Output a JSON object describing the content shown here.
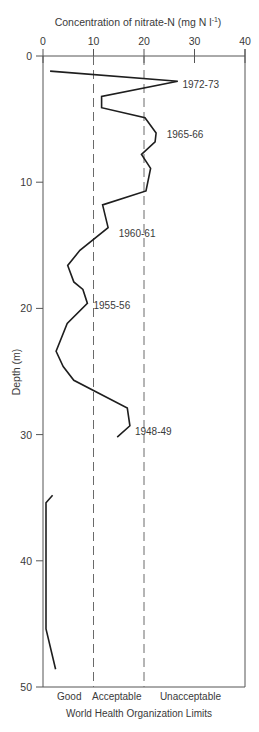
{
  "chart_data": {
    "type": "line",
    "orientation": "depth-profile",
    "title": "",
    "xlabel": "Concentration of nitrate-N (mg N l⁻¹)",
    "xlabel_base": "Concentration of nitrate-N (mg N l",
    "xlabel_sup": "-1",
    "xlabel_close": ")",
    "ylabel": "Depth (m)",
    "xlim": [
      0,
      40
    ],
    "ylim": [
      0,
      50
    ],
    "x_ticks": [
      0,
      10,
      20,
      30,
      40
    ],
    "y_ticks": [
      0,
      10,
      20,
      30,
      40,
      50
    ],
    "x_axis_position": "top",
    "y_inverted": true,
    "grid": false,
    "series": [
      {
        "name": "Nitrate-N profile (upper)",
        "points": [
          {
            "conc": 1.4,
            "depth": 1.2
          },
          {
            "conc": 26.7,
            "depth": 2.0
          },
          {
            "conc": 11.6,
            "depth": 3.2
          },
          {
            "conc": 11.6,
            "depth": 4.1
          },
          {
            "conc": 20.2,
            "depth": 4.9
          },
          {
            "conc": 22.4,
            "depth": 6.1
          },
          {
            "conc": 22.2,
            "depth": 6.8
          },
          {
            "conc": 19.5,
            "depth": 7.8
          },
          {
            "conc": 21.3,
            "depth": 8.9
          },
          {
            "conc": 20.4,
            "depth": 10.7
          },
          {
            "conc": 11.8,
            "depth": 11.8
          },
          {
            "conc": 12.9,
            "depth": 13.6
          },
          {
            "conc": 7.3,
            "depth": 15.4
          },
          {
            "conc": 4.9,
            "depth": 16.6
          },
          {
            "conc": 6.1,
            "depth": 17.9
          },
          {
            "conc": 7.9,
            "depth": 18.5
          },
          {
            "conc": 8.8,
            "depth": 19.6
          },
          {
            "conc": 4.8,
            "depth": 21.2
          },
          {
            "conc": 2.6,
            "depth": 23.4
          },
          {
            "conc": 4.0,
            "depth": 24.6
          },
          {
            "conc": 6.1,
            "depth": 25.7
          },
          {
            "conc": 16.7,
            "depth": 27.9
          },
          {
            "conc": 17.2,
            "depth": 29.3
          },
          {
            "conc": 14.7,
            "depth": 30.2
          }
        ]
      },
      {
        "name": "Nitrate-N profile (lower)",
        "points": [
          {
            "conc": 1.9,
            "depth": 34.8
          },
          {
            "conc": 0.6,
            "depth": 35.4
          },
          {
            "conc": 0.6,
            "depth": 45.4
          },
          {
            "conc": 2.5,
            "depth": 48.6
          }
        ]
      }
    ],
    "annotations": [
      {
        "text": "1972-73",
        "conc": 27.6,
        "depth": 2.2
      },
      {
        "text": "1965-66",
        "conc": 24.5,
        "depth": 6.2
      },
      {
        "text": "1960-61",
        "conc": 15.0,
        "depth": 14.0
      },
      {
        "text": "1955-56",
        "conc": 10.0,
        "depth": 19.7
      },
      {
        "text": "1948-49",
        "conc": 18.2,
        "depth": 29.7
      }
    ],
    "reference_lines": [
      {
        "conc": 10,
        "style": "dashed",
        "label": "Acceptable limit"
      },
      {
        "conc": 20,
        "style": "dashed",
        "label": "Unacceptable limit"
      }
    ],
    "who_zones": {
      "title": "World Health Organization Limits",
      "labels": [
        {
          "text": "Good",
          "conc": 5.2
        },
        {
          "text": "Acceptable",
          "conc": 14.6
        },
        {
          "text": "Unacceptable",
          "conc": 29.2
        }
      ]
    }
  },
  "colors": {
    "line": "#1e1e1e",
    "axis": "#555555",
    "dash": "#6a6a6a",
    "text": "#3a3a3a"
  }
}
